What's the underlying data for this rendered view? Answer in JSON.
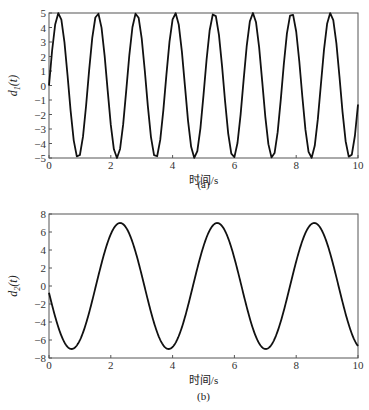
{
  "chart_data": [
    {
      "type": "line",
      "panel": "(a)",
      "caption": "(a)",
      "xlabel": "时间/s",
      "ylabel": "d1(t)",
      "ylabel_main": "d",
      "ylabel_sub": "1",
      "ylabel_tail": "(t)",
      "xlim": [
        0,
        10
      ],
      "ylim": [
        -5,
        5
      ],
      "xticks": [
        0,
        2,
        4,
        6,
        8,
        10
      ],
      "yticks": [
        5,
        4,
        3,
        2,
        1,
        0,
        -1,
        -2,
        -3,
        -4,
        -5
      ],
      "grid": false,
      "legend": null,
      "series": [
        {
          "name": "d1(t)",
          "formula": "5*sin(5t)",
          "sample_step": 0.1
        }
      ],
      "peaks_t": [
        0.31,
        1.57,
        2.83,
        4.08,
        5.34,
        6.6,
        7.85,
        9.11
      ],
      "amplitude": 5
    },
    {
      "type": "line",
      "panel": "(b)",
      "caption": "(b)",
      "xlabel": "时间/s",
      "ylabel": "d2(t)",
      "ylabel_main": "d",
      "ylabel_sub": "2",
      "ylabel_tail": "(t)",
      "xlim": [
        0,
        10
      ],
      "ylim": [
        -8,
        8
      ],
      "xticks": [
        0,
        2,
        4,
        6,
        8,
        10
      ],
      "yticks": [
        8,
        6,
        4,
        2,
        0,
        -2,
        -4,
        -6,
        -8
      ],
      "grid": false,
      "legend": null,
      "series": [
        {
          "name": "d2(t)",
          "formula": "7*sin(2t+3.25)",
          "sample_step": 0.02
        }
      ],
      "peaks_t": [
        2.3,
        5.45,
        8.6
      ],
      "troughs_t": [
        0.7,
        3.85,
        7.0
      ],
      "amplitude": 7
    }
  ],
  "colors": {
    "line": "#111111",
    "axis": "#555555",
    "text": "#333333"
  }
}
